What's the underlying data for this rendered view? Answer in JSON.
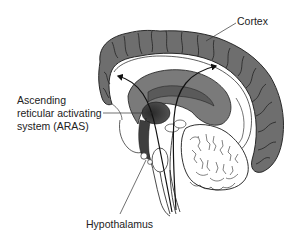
{
  "figure": {
    "type": "anatomical-diagram",
    "labels": {
      "cortex": "Cortex",
      "aras_line1": "Ascending",
      "aras_line2": "reticular activating",
      "aras_line3": "system (ARAS)",
      "hypothalamus": "Hypothalamus"
    },
    "colors": {
      "background": "#ffffff",
      "cortex_fill": "#6e6e6e",
      "corpus_callosum_fill": "#7a7a7a",
      "thalamus_dark": "#3a3a3a",
      "outline": "#1a1a1a",
      "white_matter": "#ffffff",
      "text": "#222222"
    }
  }
}
